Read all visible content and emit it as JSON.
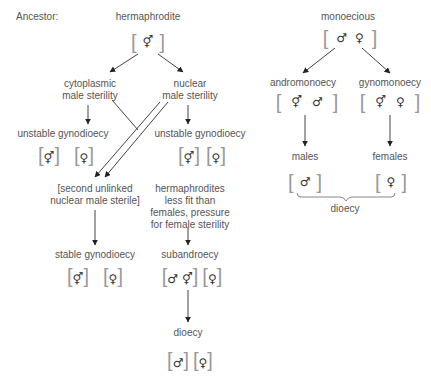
{
  "ancestor_label": "Ancestor:",
  "left_tree": {
    "root": {
      "label": "hermaphrodite",
      "symbols": [
        "⚥"
      ]
    },
    "cytoplasmic": {
      "line1": "cytoplasmic",
      "line2": "male sterility"
    },
    "nuclear": {
      "line1": "nuclear",
      "line2": "male sterility"
    },
    "unstable_left": {
      "label": "unstable gynodioecy",
      "symbols": [
        "⚥",
        "♀"
      ]
    },
    "unstable_right": {
      "label": "unstable gynodioecy",
      "symbols": [
        "⚥",
        "♀"
      ]
    },
    "second_unlinked": {
      "line1": "[second unlinked",
      "line2": "nuclear male sterile]"
    },
    "pressure": {
      "line1": "hermaphrodites",
      "line2": "less fit than",
      "line3": "females, pressure",
      "line4": "for female sterility"
    },
    "stable": {
      "label": "stable gynodioecy",
      "symbols": [
        "⚥",
        "♀"
      ]
    },
    "subandroecy": {
      "label": "subandroecy",
      "symbols_group1": [
        "♂",
        "⚥"
      ],
      "symbols_group2": [
        "♀"
      ]
    },
    "dioecy": {
      "label": "dioecy",
      "symbols": [
        "♂",
        "♀"
      ]
    }
  },
  "right_tree": {
    "root": {
      "label": "monoecious",
      "symbols": [
        "♂",
        "♀"
      ]
    },
    "andromonoecy": {
      "label": "andromonoecy",
      "symbols": [
        "⚥",
        "♂"
      ]
    },
    "gynomonoecy": {
      "label": "gynomonoecy",
      "symbols": [
        "⚥",
        "♀"
      ]
    },
    "males": {
      "label": "males",
      "symbols": [
        "♂"
      ]
    },
    "females": {
      "label": "females",
      "symbols": [
        "♀"
      ]
    },
    "dioecy_brace": {
      "label": "dioecy"
    }
  }
}
